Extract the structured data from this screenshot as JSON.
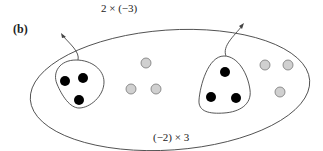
{
  "figure": {
    "panel_label": "(b)",
    "top_annotation": "2 × (−3)",
    "bottom_annotation": "(−2) × 3",
    "colors": {
      "outline": "#444444",
      "black_dot": "#000000",
      "gray_dot_fill": "#d0d0d0",
      "gray_dot_stroke": "#777777"
    },
    "groups": [
      {
        "name": "left-group",
        "black_dots": 3
      },
      {
        "name": "right-group",
        "black_dots": 3
      }
    ],
    "loose_gray_dots": {
      "middle": 3,
      "right": 3
    }
  }
}
